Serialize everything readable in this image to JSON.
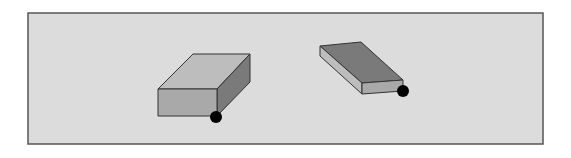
{
  "figure": {
    "frame": {
      "x": 28,
      "y": 13,
      "width": 515,
      "height": 131,
      "fill": "#dcdcdc",
      "stroke": "#555555"
    },
    "colors": {
      "light_face": "#bdbdbd",
      "mid_face": "#a9a9a9",
      "dark_face": "#7a7a7a",
      "edge": "#333333",
      "dot": "#000000"
    },
    "blocks": [
      {
        "name": "left-block",
        "front_face": [
          [
            158,
            89
          ],
          [
            217,
            89
          ],
          [
            217,
            116
          ],
          [
            158,
            116
          ]
        ],
        "top_face": [
          [
            158,
            89
          ],
          [
            193,
            54
          ],
          [
            250,
            54
          ],
          [
            217,
            89
          ]
        ],
        "side_face": [
          [
            217,
            89
          ],
          [
            250,
            54
          ],
          [
            250,
            82
          ],
          [
            217,
            116
          ]
        ],
        "corner_dot": {
          "cx": 216,
          "cy": 117,
          "r": 6
        }
      },
      {
        "name": "right-block",
        "top_face": [
          [
            320,
            46
          ],
          [
            361,
            42
          ],
          [
            403,
            80
          ],
          [
            362,
            83
          ]
        ],
        "side_face": [
          [
            320,
            46
          ],
          [
            362,
            83
          ],
          [
            362,
            94
          ],
          [
            320,
            56
          ]
        ],
        "front_face": [
          [
            362,
            83
          ],
          [
            403,
            80
          ],
          [
            403,
            91
          ],
          [
            362,
            94
          ]
        ],
        "corner_dot": {
          "cx": 403,
          "cy": 91,
          "r": 6
        }
      }
    ]
  }
}
